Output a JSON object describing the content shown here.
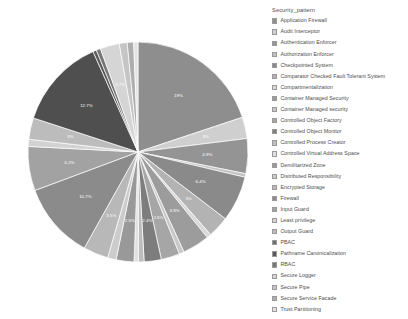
{
  "legend": {
    "title": "Security_pattern",
    "items": [
      {
        "label": "Application Firewall",
        "color": "#8e8e8e"
      },
      {
        "label": "Audit Interceptor",
        "color": "#cfcfcf"
      },
      {
        "label": "Authentication Enforcer",
        "color": "#949494"
      },
      {
        "label": "Authorization Enforcer",
        "color": "#c2c2c2"
      },
      {
        "label": "Checkpointed System",
        "color": "#8a8a8a"
      },
      {
        "label": "Comparator Checked Fault Tolerant System",
        "color": "#b3b3b3"
      },
      {
        "label": "Compartmentalization",
        "color": "#d8d8d8"
      },
      {
        "label": "Container Managed Security",
        "color": "#9c9c9c"
      },
      {
        "label": "Container Managed security",
        "color": "#c8c8c8"
      },
      {
        "label": "Controlled Object Factory",
        "color": "#a6a6a6"
      },
      {
        "label": "Controlled Object Monitor",
        "color": "#7d7d7d"
      },
      {
        "label": "Controlled Process Creator",
        "color": "#bdbdbd"
      },
      {
        "label": "Controlled Virtual Address Space",
        "color": "#e0e0e0"
      },
      {
        "label": "Demilitarized Zone",
        "color": "#999999"
      },
      {
        "label": "Distributed Responsibility",
        "color": "#cccccc"
      },
      {
        "label": "Encrypted Storage",
        "color": "#b8b8b8"
      },
      {
        "label": "Firewall",
        "color": "#8b8b8b"
      },
      {
        "label": "Input Guard",
        "color": "#a2a2a2"
      },
      {
        "label": "Least privilege",
        "color": "#d2d2d2"
      },
      {
        "label": "Output Guard",
        "color": "#bcbcbc"
      },
      {
        "label": "PBAC",
        "color": "#6f6f6f"
      },
      {
        "label": "Pathname Canonicalization",
        "color": "#5a5a5a"
      },
      {
        "label": "RBAC",
        "color": "#777777"
      },
      {
        "label": "Secure Logger",
        "color": "#d5d5d5"
      },
      {
        "label": "Secure Pipe",
        "color": "#c5c5c5"
      },
      {
        "label": "Secure Service Facade",
        "color": "#aeaeae"
      },
      {
        "label": "Trust Partitioning",
        "color": "#e4e4e4"
      }
    ]
  },
  "chart_data": {
    "type": "pie",
    "title": "",
    "legend_title": "Security_pattern",
    "legend_position": "right",
    "label_format": "percent",
    "start_angle_deg": 0,
    "direction": "clockwise",
    "center": {
      "x": 138,
      "y": 152
    },
    "radius": 110,
    "categories": [
      "Application Firewall",
      "Audit Interceptor",
      "Authentication Enforcer",
      "Authorization Enforcer",
      "Checkpointed System",
      "Comparator Checked Fault Tolerant System",
      "Compartmentalization",
      "Container Managed Security",
      "Container Managed security",
      "Controlled Object Factory",
      "Controlled Object Monitor",
      "Controlled Process Creator",
      "Controlled Virtual Address Space",
      "Demilitarized Zone",
      "Distributed Responsibility",
      "Encrypted Storage",
      "Firewall",
      "Input Guard",
      "Least privilege",
      "Output Guard",
      "PBAC",
      "Pathname Canonicalization",
      "RBAC",
      "Secure Logger",
      "Secure Pipe",
      "Secure Service Facade",
      "Trust Partitioning"
    ],
    "values": [
      19,
      3,
      4.9,
      0.5,
      6.4,
      3,
      0.6,
      3.8,
      0.7,
      2.6,
      2.4,
      0.8,
      0.6,
      2.5,
      1.2,
      3.5,
      10.7,
      6.2,
      1.0,
      3.0,
      12.7,
      0.5,
      0.6,
      2.7,
      1.1,
      0.9,
      0.6
    ],
    "slices": [
      {
        "label": "19%",
        "value": 19,
        "color": "#8e8e8e",
        "show_label": true
      },
      {
        "label": "3%",
        "value": 3,
        "color": "#cfcfcf",
        "show_label": true
      },
      {
        "label": "4.9%",
        "value": 4.9,
        "color": "#949494",
        "show_label": true
      },
      {
        "label": "",
        "value": 0.5,
        "color": "#c2c2c2",
        "show_label": false
      },
      {
        "label": "6.4%",
        "value": 6.4,
        "color": "#8a8a8a",
        "show_label": true
      },
      {
        "label": "3%",
        "value": 3,
        "color": "#b3b3b3",
        "show_label": true
      },
      {
        "label": "",
        "value": 0.6,
        "color": "#d8d8d8",
        "show_label": false
      },
      {
        "label": "3.8%",
        "value": 3.8,
        "color": "#9c9c9c",
        "show_label": true
      },
      {
        "label": "",
        "value": 0.7,
        "color": "#c8c8c8",
        "show_label": false
      },
      {
        "label": "2.6%",
        "value": 2.6,
        "color": "#a6a6a6",
        "show_label": true
      },
      {
        "label": "2.4%",
        "value": 2.4,
        "color": "#7d7d7d",
        "show_label": true
      },
      {
        "label": "",
        "value": 0.8,
        "color": "#bdbdbd",
        "show_label": false
      },
      {
        "label": "",
        "value": 0.6,
        "color": "#e0e0e0",
        "show_label": false
      },
      {
        "label": "2.5%",
        "value": 2.5,
        "color": "#999999",
        "show_label": true
      },
      {
        "label": "",
        "value": 1.2,
        "color": "#cccccc",
        "show_label": false
      },
      {
        "label": "3.5%",
        "value": 3.5,
        "color": "#b8b8b8",
        "show_label": true
      },
      {
        "label": "10.7%",
        "value": 10.7,
        "color": "#8b8b8b",
        "show_label": true
      },
      {
        "label": "6.2%",
        "value": 6.2,
        "color": "#a2a2a2",
        "show_label": true
      },
      {
        "label": "",
        "value": 1.0,
        "color": "#d2d2d2",
        "show_label": false
      },
      {
        "label": "3%",
        "value": 3.0,
        "color": "#bcbcbc",
        "show_label": true
      },
      {
        "label": "12.7%",
        "value": 12.7,
        "color": "#4f4f4f",
        "show_label": true
      },
      {
        "label": "",
        "value": 0.5,
        "color": "#5a5a5a",
        "show_label": false
      },
      {
        "label": "",
        "value": 0.6,
        "color": "#777777",
        "show_label": false
      },
      {
        "label": "2.7%",
        "value": 2.7,
        "color": "#d5d5d5",
        "show_label": true
      },
      {
        "label": "",
        "value": 1.1,
        "color": "#c5c5c5",
        "show_label": false
      },
      {
        "label": "",
        "value": 0.9,
        "color": "#aeaeae",
        "show_label": false
      },
      {
        "label": "",
        "value": 0.6,
        "color": "#e4e4e4",
        "show_label": false
      }
    ]
  }
}
